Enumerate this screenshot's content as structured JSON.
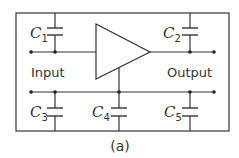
{
  "diagram": {
    "caption": "(a)",
    "input_label": "Input",
    "output_label": "Output",
    "amplifier": "triangle-amplifier",
    "capacitors": [
      {
        "id": "C1",
        "letter": "C",
        "sub": "1",
        "position": "input-to-top-rail"
      },
      {
        "id": "C2",
        "letter": "C",
        "sub": "2",
        "position": "output-to-top-rail"
      },
      {
        "id": "C3",
        "letter": "C",
        "sub": "3",
        "position": "input-rail-to-bottom"
      },
      {
        "id": "C4",
        "letter": "C",
        "sub": "4",
        "position": "amplifier-ground-to-bottom"
      },
      {
        "id": "C5",
        "letter": "C",
        "sub": "5",
        "position": "output-rail-to-bottom"
      }
    ],
    "colors": {
      "line": "#333333",
      "background": "#ffffff"
    }
  }
}
